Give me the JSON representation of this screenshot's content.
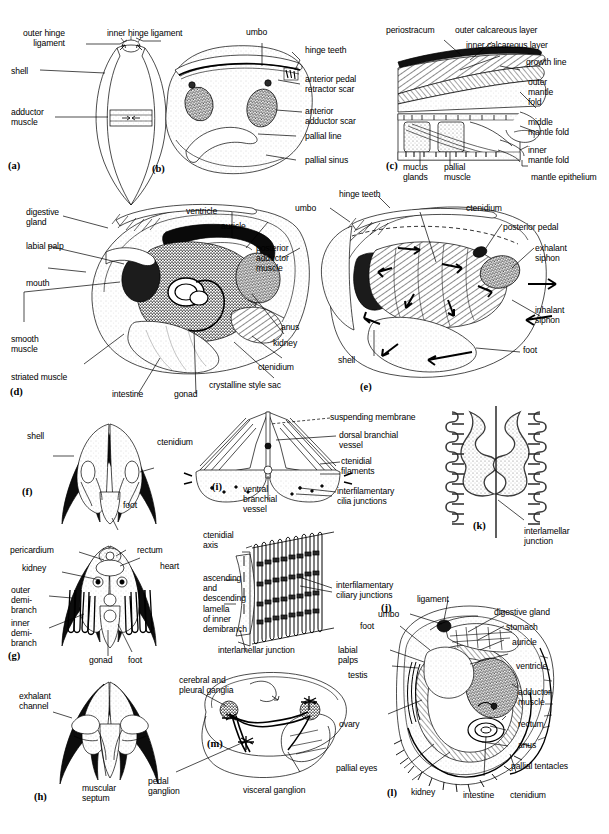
{
  "figure": {
    "panels": [
      "(a)",
      "(b)",
      "(c)",
      "(d)",
      "(e)",
      "(f)",
      "(g)",
      "(h)",
      "(i)",
      "(j)",
      "(k)",
      "(l)",
      "(m)"
    ]
  },
  "panel_a": {
    "id": "(a)",
    "labels": [
      {
        "text": "outer hinge\nligament"
      },
      {
        "text": "inner hinge ligament"
      },
      {
        "text": "shell"
      },
      {
        "text": "adductor\nmuscle"
      }
    ]
  },
  "panel_b": {
    "id": "(b)",
    "labels": [
      {
        "text": "umbo"
      },
      {
        "text": "hinge teeth"
      },
      {
        "text": "anterior pedal\nretractor scar"
      },
      {
        "text": "anterior\nadductor scar"
      },
      {
        "text": "pallial line"
      },
      {
        "text": "pallial sinus"
      }
    ]
  },
  "panel_c": {
    "id": "(c)",
    "labels": [
      {
        "text": "periostracum"
      },
      {
        "text": "outer calcareous layer"
      },
      {
        "text": "inner calcareous layer"
      },
      {
        "text": "growth line"
      },
      {
        "text": "outer\nmantle\nfold"
      },
      {
        "text": "middle\nmantle fold"
      },
      {
        "text": "inner\nmantle fold"
      },
      {
        "text": "mantle epithelium"
      },
      {
        "text": "mucus\nglands"
      },
      {
        "text": "pallial\nmuscle"
      }
    ]
  },
  "panel_d": {
    "id": "(d)",
    "labels": [
      {
        "text": "digestive\ngland"
      },
      {
        "text": "labial palp"
      },
      {
        "text": "mouth"
      },
      {
        "text": "smooth\nmuscle"
      },
      {
        "text": "striated muscle"
      },
      {
        "text": "intestine"
      },
      {
        "text": "gonad"
      },
      {
        "text": "ventricle"
      },
      {
        "text": "auricle"
      },
      {
        "text": "posterior\nadductor\nmuscle"
      },
      {
        "text": "anus"
      },
      {
        "text": "kidney"
      },
      {
        "text": "ctenidium"
      },
      {
        "text": "crystalline style sac"
      }
    ]
  },
  "panel_e": {
    "id": "(e)",
    "labels": [
      {
        "text": "hinge teeth"
      },
      {
        "text": "umbo"
      },
      {
        "text": "ctenidium"
      },
      {
        "text": "posterior pedal"
      },
      {
        "text": "exhalant\nsiphon"
      },
      {
        "text": "inhalant\nsiphon"
      },
      {
        "text": "foot"
      },
      {
        "text": "shell"
      }
    ]
  },
  "panel_f": {
    "id": "(f)",
    "labels": [
      {
        "text": "shell"
      },
      {
        "text": "ctenidium"
      },
      {
        "text": "foot"
      }
    ]
  },
  "panel_g": {
    "id": "(g)",
    "labels": [
      {
        "text": "pericardium"
      },
      {
        "text": "rectum"
      },
      {
        "text": "heart"
      },
      {
        "text": "kidney"
      },
      {
        "text": "outer\ndemi-\nbranch"
      },
      {
        "text": "inner\ndemi-\nbranch"
      },
      {
        "text": "gonad"
      },
      {
        "text": "foot"
      }
    ]
  },
  "panel_h": {
    "id": "(h)",
    "labels": [
      {
        "text": "exhalant\nchannel"
      },
      {
        "text": "muscular\nseptum"
      }
    ]
  },
  "panel_i": {
    "id": "(i)",
    "labels": [
      {
        "text": "suspending membrane"
      },
      {
        "text": "dorsal branchial\nvessel"
      },
      {
        "text": "ctenidial\nfilaments"
      },
      {
        "text": "interfilamentary\ncilia junctions"
      },
      {
        "text": "ventral\nbranchial\nvessel"
      }
    ]
  },
  "panel_j": {
    "id": "(j)",
    "labels": [
      {
        "text": "ctenidial\naxis"
      },
      {
        "text": "ascending\nand\ndescending\nlamella\nof inner\ndemibranch"
      },
      {
        "text": "interfilamentary\nciliary junctions"
      },
      {
        "text": "interlamellar junction"
      }
    ]
  },
  "panel_k": {
    "id": "(k)",
    "labels": [
      {
        "text": "interlamellar\njunction"
      }
    ]
  },
  "panel_l": {
    "id": "(l)",
    "labels": [
      {
        "text": "ligament"
      },
      {
        "text": "umbo"
      },
      {
        "text": "foot"
      },
      {
        "text": "labial\npalps"
      },
      {
        "text": "testis"
      },
      {
        "text": "ovary"
      },
      {
        "text": "pallial eyes"
      },
      {
        "text": "kidney"
      },
      {
        "text": "digestive gland"
      },
      {
        "text": "stomach"
      },
      {
        "text": "auricle"
      },
      {
        "text": "ventricle"
      },
      {
        "text": "adductor\nmuscle"
      },
      {
        "text": "rectum"
      },
      {
        "text": "anus"
      },
      {
        "text": "pallial tentacles"
      },
      {
        "text": "intestine"
      },
      {
        "text": "ctenidium"
      }
    ]
  },
  "panel_m": {
    "id": "(m)",
    "labels": [
      {
        "text": "cerebral and\npleural ganglia"
      },
      {
        "text": "pedal\nganglion"
      },
      {
        "text": "visceral ganglion"
      }
    ]
  },
  "colors": {
    "ink": "#000000",
    "paper": "#ffffff",
    "stipple_light": "#dcdcdc",
    "stipple_mid": "#9a9a9a",
    "stipple_dark": "#5a5a5a"
  }
}
